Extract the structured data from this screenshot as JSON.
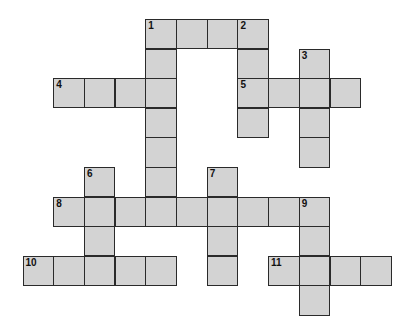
{
  "puzzle": {
    "type": "crossword",
    "origin": {
      "x": 22.5,
      "y": 19
    },
    "cell_w": 30.7,
    "cell_h": 29.6,
    "cell_color": "#d3d3d3",
    "border_color": "#2a2a2a",
    "entries": [
      {
        "number": "1",
        "direction": "across",
        "row": 0,
        "col": 4,
        "length": 4
      },
      {
        "number": "1",
        "direction": "down",
        "row": 0,
        "col": 4,
        "length": 7
      },
      {
        "number": "2",
        "direction": "down",
        "row": 0,
        "col": 7,
        "length": 4
      },
      {
        "number": "3",
        "direction": "down",
        "row": 1,
        "col": 9,
        "length": 4
      },
      {
        "number": "4",
        "direction": "across",
        "row": 2,
        "col": 1,
        "length": 4
      },
      {
        "number": "5",
        "direction": "across",
        "row": 2,
        "col": 7,
        "length": 4
      },
      {
        "number": "6",
        "direction": "down",
        "row": 5,
        "col": 2,
        "length": 4
      },
      {
        "number": "7",
        "direction": "down",
        "row": 5,
        "col": 6,
        "length": 4
      },
      {
        "number": "8",
        "direction": "across",
        "row": 6,
        "col": 1,
        "length": 9
      },
      {
        "number": "9",
        "direction": "down",
        "row": 6,
        "col": 9,
        "length": 4
      },
      {
        "number": "10",
        "direction": "across",
        "row": 8,
        "col": 0,
        "length": 5
      },
      {
        "number": "11",
        "direction": "across",
        "row": 8,
        "col": 8,
        "length": 4
      }
    ]
  }
}
